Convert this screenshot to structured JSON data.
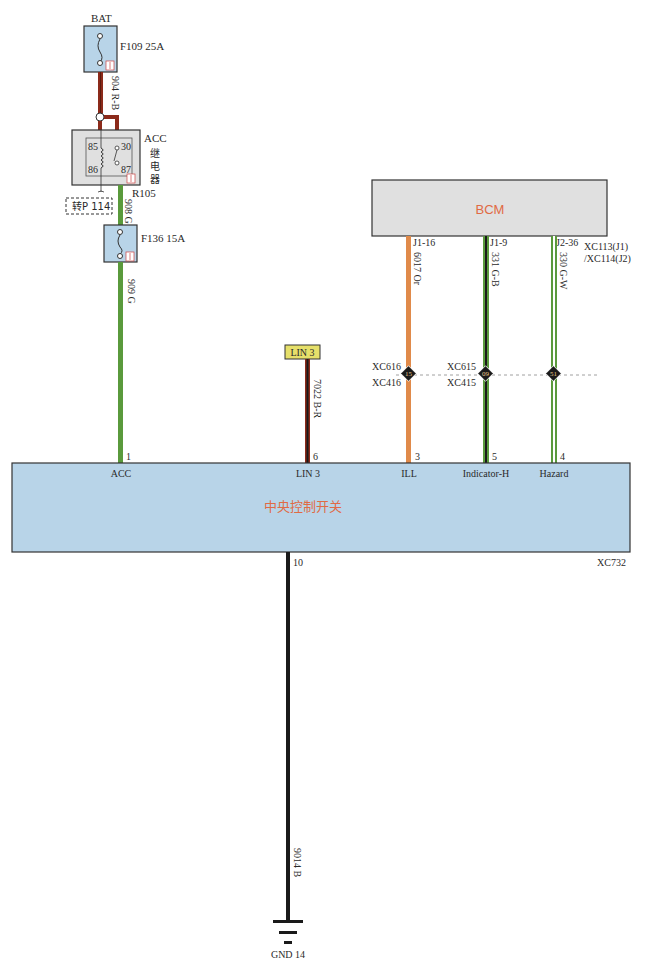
{
  "diagram": {
    "battery_label": "BAT",
    "fuse_f109": {
      "label": "F109 25A"
    },
    "wire_904": "904 R-B",
    "relay": {
      "name_line1": "ACC",
      "name_line2": "继",
      "name_line3": "电",
      "name_line4": "器",
      "pin85": "85",
      "pin86": "86",
      "pin30": "30",
      "pin87": "87",
      "ref": "R105"
    },
    "goto_ref": "转P 114",
    "wire_908": "908 G",
    "fuse_f136": {
      "label": "F136 15A"
    },
    "wire_909": "909 G",
    "bcm": {
      "title": "BCM",
      "pins": [
        "J1-16",
        "J1-9",
        "J2-36"
      ],
      "connector_line1": "XC113(J1)",
      "connector_line2": "/XC114(J2)"
    },
    "wires_bcm": [
      "6017 Or",
      "331 G-B",
      "330 G-W"
    ],
    "lin_tag": "LIN 3",
    "wire_7022": "7022 B-R",
    "splices": {
      "ill_top": "XC616",
      "ill_bottom": "XC416",
      "ill_num": "15",
      "ind_top": "XC615",
      "ind_bottom": "XC415",
      "ind_num": "09",
      "haz_num": "51"
    },
    "switch": {
      "title": "中央控制开关",
      "connector": "XC732",
      "pins": [
        {
          "num": "1",
          "name": "ACC"
        },
        {
          "num": "6",
          "name": "LIN 3"
        },
        {
          "num": "3",
          "name": "ILL"
        },
        {
          "num": "5",
          "name": "Indicator-H"
        },
        {
          "num": "4",
          "name": "Hazard"
        }
      ],
      "ground_pin": "10"
    },
    "wire_9014": "9014 B",
    "ground_label": "GND 14"
  },
  "colors": {
    "red_black_wire": "#8b2a1a",
    "green_wire": "#5a9a3c",
    "orange_wire": "#e08a4a",
    "black_wire": "#1a1a1a",
    "module_fill": "#b8d4e8",
    "bcm_fill": "#e0e0e0",
    "title_red": "#e06a44",
    "lin_tag_fill": "#e6e06a"
  }
}
